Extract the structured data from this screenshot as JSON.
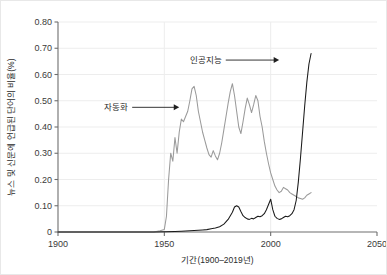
{
  "chart_data": {
    "type": "line",
    "title": "",
    "xlabel": "기간(1900–2019년)",
    "ylabel": "뉴스 및 신문에 언급된 단어의 비율(%)",
    "xlim": [
      1900,
      2050
    ],
    "ylim": [
      0,
      0.8
    ],
    "grid": true,
    "legend_position": "none",
    "xticks": [
      "1900",
      "1950",
      "2000",
      "2050"
    ],
    "xtick_values": [
      1900,
      1950,
      2000,
      2050
    ],
    "yticks": [
      "0",
      "0.10",
      "0.20",
      "0.30",
      "0.40",
      "0.50",
      "0.60",
      "0.70",
      "0.80"
    ],
    "ytick_values": [
      0,
      0.1,
      0.2,
      0.3,
      0.4,
      0.5,
      0.6,
      0.7,
      0.8
    ],
    "annotations": [
      {
        "label": "자동화",
        "text_x": 1933,
        "text_y": 0.475,
        "arrow_to_x": 1957,
        "arrow_to_y": 0.475
      },
      {
        "label": "인공지능",
        "text_x": 1977,
        "text_y": 0.655,
        "arrow_to_x": 2004,
        "arrow_to_y": 0.655
      }
    ],
    "series": [
      {
        "name": "자동화",
        "color": "#9a9a9a",
        "x": [
          1900,
          1905,
          1910,
          1915,
          1920,
          1925,
          1930,
          1935,
          1940,
          1945,
          1948,
          1950,
          1951,
          1952,
          1953,
          1954,
          1955,
          1956,
          1957,
          1958,
          1959,
          1960,
          1961,
          1962,
          1963,
          1964,
          1965,
          1966,
          1967,
          1968,
          1969,
          1970,
          1971,
          1972,
          1973,
          1974,
          1975,
          1976,
          1977,
          1978,
          1979,
          1980,
          1981,
          1982,
          1983,
          1984,
          1985,
          1986,
          1987,
          1988,
          1989,
          1990,
          1991,
          1992,
          1993,
          1994,
          1995,
          1996,
          1997,
          1998,
          1999,
          2000,
          2001,
          2002,
          2003,
          2004,
          2005,
          2006,
          2007,
          2008,
          2009,
          2010,
          2011,
          2012,
          2013,
          2014,
          2015,
          2016,
          2017,
          2018,
          2019
        ],
        "values": [
          0,
          0,
          0,
          0,
          0,
          0,
          0,
          0,
          0,
          0,
          0.005,
          0.01,
          0.06,
          0.2,
          0.3,
          0.27,
          0.36,
          0.3,
          0.38,
          0.43,
          0.42,
          0.44,
          0.46,
          0.5,
          0.545,
          0.555,
          0.52,
          0.46,
          0.42,
          0.38,
          0.35,
          0.32,
          0.295,
          0.285,
          0.31,
          0.29,
          0.275,
          0.3,
          0.34,
          0.39,
          0.44,
          0.49,
          0.535,
          0.565,
          0.52,
          0.46,
          0.4,
          0.375,
          0.42,
          0.47,
          0.51,
          0.485,
          0.455,
          0.485,
          0.52,
          0.5,
          0.44,
          0.4,
          0.345,
          0.3,
          0.26,
          0.225,
          0.2,
          0.175,
          0.16,
          0.15,
          0.155,
          0.17,
          0.165,
          0.16,
          0.15,
          0.145,
          0.14,
          0.135,
          0.13,
          0.128,
          0.125,
          0.13,
          0.14,
          0.145,
          0.15
        ]
      },
      {
        "name": "인공지능",
        "color": "#1a1a1a",
        "x": [
          1900,
          1905,
          1910,
          1915,
          1920,
          1925,
          1930,
          1935,
          1940,
          1945,
          1950,
          1955,
          1958,
          1960,
          1962,
          1964,
          1966,
          1968,
          1970,
          1972,
          1974,
          1976,
          1978,
          1980,
          1982,
          1983,
          1984,
          1985,
          1986,
          1987,
          1988,
          1989,
          1990,
          1991,
          1992,
          1993,
          1994,
          1995,
          1996,
          1997,
          1998,
          1999,
          2000,
          2001,
          2002,
          2003,
          2004,
          2005,
          2006,
          2007,
          2008,
          2009,
          2010,
          2011,
          2012,
          2013,
          2014,
          2015,
          2016,
          2017,
          2018,
          2019
        ],
        "values": [
          0,
          0,
          0,
          0,
          0,
          0,
          0,
          0,
          0,
          0,
          0.001,
          0.002,
          0.003,
          0.004,
          0.005,
          0.006,
          0.007,
          0.008,
          0.009,
          0.012,
          0.015,
          0.02,
          0.03,
          0.048,
          0.075,
          0.095,
          0.1,
          0.095,
          0.078,
          0.062,
          0.055,
          0.05,
          0.048,
          0.052,
          0.05,
          0.055,
          0.06,
          0.058,
          0.062,
          0.07,
          0.085,
          0.105,
          0.125,
          0.085,
          0.06,
          0.052,
          0.048,
          0.05,
          0.055,
          0.06,
          0.058,
          0.062,
          0.07,
          0.085,
          0.12,
          0.19,
          0.28,
          0.38,
          0.48,
          0.57,
          0.64,
          0.68
        ]
      }
    ]
  }
}
